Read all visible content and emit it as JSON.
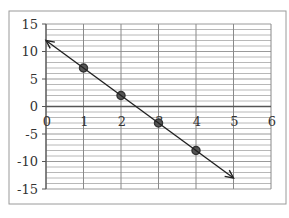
{
  "chart_data": {
    "type": "line",
    "title": "",
    "xlabel": "",
    "ylabel": "",
    "xlim": [
      0,
      6
    ],
    "ylim": [
      -15,
      15
    ],
    "x_ticks": [
      0,
      1,
      2,
      3,
      4,
      5,
      6
    ],
    "x_tick_labels": [
      "0",
      "1",
      "2",
      "3",
      "4",
      "5",
      "6"
    ],
    "y_ticks": [
      15,
      10,
      5,
      0,
      -5,
      -10,
      -15
    ],
    "y_tick_labels": [
      "15",
      "10",
      "5",
      "0",
      "-5",
      "-10",
      "-15"
    ],
    "grid": {
      "major_x_step": 1,
      "minor_y_step": 1,
      "on": true
    },
    "legend": null,
    "series": [
      {
        "name": "points",
        "style": "markers",
        "x": [
          1,
          2,
          3,
          4
        ],
        "y": [
          7,
          2,
          -3,
          -8
        ]
      },
      {
        "name": "line y = 12 - 5x",
        "style": "line-with-arrows",
        "x": [
          0,
          5
        ],
        "y": [
          12,
          -13
        ]
      }
    ],
    "colors": {
      "frame": "#9a9a9a",
      "grid": "#b8b8b8",
      "axis": "#555555",
      "line": "#222222",
      "marker": "#333333"
    }
  }
}
